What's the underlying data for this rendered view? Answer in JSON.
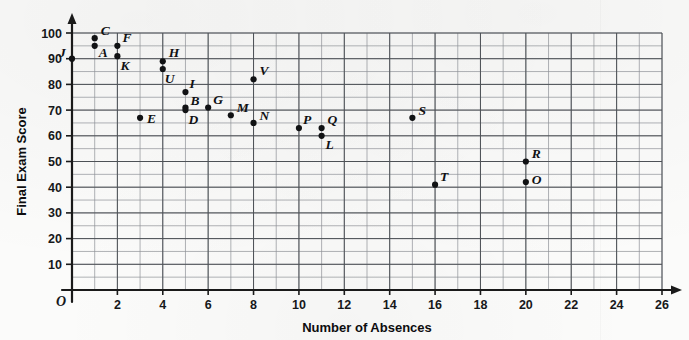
{
  "chart_data": {
    "type": "scatter",
    "title": "",
    "xlabel": "Number of Absences",
    "ylabel": "Final Exam Score",
    "origin_label": "O",
    "xlim": [
      0,
      26
    ],
    "ylim": [
      0,
      100
    ],
    "x_tick_step": 2,
    "y_tick_step": 10,
    "x_grid_step": 1,
    "y_grid_step": 5,
    "grid": true,
    "legend": "none",
    "x_ticks": [
      2,
      4,
      6,
      8,
      10,
      12,
      14,
      16,
      18,
      20,
      22,
      24,
      26
    ],
    "y_ticks": [
      10,
      20,
      30,
      40,
      50,
      60,
      70,
      80,
      90,
      100
    ],
    "point_color": "#111214",
    "grid_color": "#8e9196",
    "axis_color": "#1a1a1a",
    "points": [
      {
        "label": "J",
        "x": 0,
        "y": 90,
        "lx": -13,
        "ly": -2
      },
      {
        "label": "C",
        "x": 1,
        "y": 98,
        "lx": 6,
        "ly": -3
      },
      {
        "label": "A",
        "x": 1,
        "y": 95,
        "lx": 4,
        "ly": 11
      },
      {
        "label": "F",
        "x": 2,
        "y": 95,
        "lx": 5,
        "ly": -4
      },
      {
        "label": "K",
        "x": 2,
        "y": 91,
        "lx": 3,
        "ly": 14
      },
      {
        "label": "E",
        "x": 3,
        "y": 67,
        "lx": 7,
        "ly": 5
      },
      {
        "label": "H",
        "x": 4,
        "y": 89,
        "lx": 6,
        "ly": -4
      },
      {
        "label": "U",
        "x": 4,
        "y": 86,
        "lx": 2,
        "ly": 14
      },
      {
        "label": "I",
        "x": 5,
        "y": 77,
        "lx": 4,
        "ly": -4
      },
      {
        "label": "B",
        "x": 5,
        "y": 71,
        "lx": 5,
        "ly": -3
      },
      {
        "label": "D",
        "x": 5,
        "y": 70,
        "lx": 3,
        "ly": 14
      },
      {
        "label": "G",
        "x": 6,
        "y": 71,
        "lx": 5,
        "ly": -4
      },
      {
        "label": "M",
        "x": 7,
        "y": 68,
        "lx": 6,
        "ly": -3
      },
      {
        "label": "V",
        "x": 8,
        "y": 82,
        "lx": 6,
        "ly": -4
      },
      {
        "label": "N",
        "x": 8,
        "y": 65,
        "lx": 6,
        "ly": -3
      },
      {
        "label": "P",
        "x": 10,
        "y": 63,
        "lx": 4,
        "ly": -4
      },
      {
        "label": "Q",
        "x": 11,
        "y": 63,
        "lx": 6,
        "ly": -4
      },
      {
        "label": "L",
        "x": 11,
        "y": 60,
        "lx": 4,
        "ly": 13
      },
      {
        "label": "S",
        "x": 15,
        "y": 67,
        "lx": 6,
        "ly": -3
      },
      {
        "label": "T",
        "x": 16,
        "y": 41,
        "lx": 5,
        "ly": -4
      },
      {
        "label": "R",
        "x": 20,
        "y": 50,
        "lx": 6,
        "ly": -4
      },
      {
        "label": "O",
        "x": 20,
        "y": 42,
        "lx": 6,
        "ly": 2
      }
    ]
  }
}
